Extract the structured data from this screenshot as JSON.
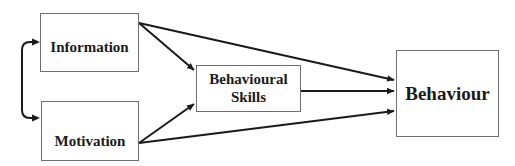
{
  "diagram": {
    "type": "flow-model",
    "nodes": [
      {
        "id": "information",
        "label": "Information"
      },
      {
        "id": "motivation",
        "label": "Motivation"
      },
      {
        "id": "skills",
        "label": "Behavioural Skills",
        "lines": [
          "Behavioural",
          "Skills"
        ]
      },
      {
        "id": "behaviour",
        "label": "Behaviour"
      }
    ],
    "edges": [
      {
        "from": "information",
        "to": "motivation",
        "bidirectional": true
      },
      {
        "from": "information",
        "to": "skills"
      },
      {
        "from": "information",
        "to": "behaviour"
      },
      {
        "from": "motivation",
        "to": "skills"
      },
      {
        "from": "motivation",
        "to": "behaviour"
      },
      {
        "from": "skills",
        "to": "behaviour"
      }
    ],
    "colors": {
      "line": "#1a1a1a",
      "border": "#6e6e6e",
      "text": "#1a1a1a"
    }
  }
}
